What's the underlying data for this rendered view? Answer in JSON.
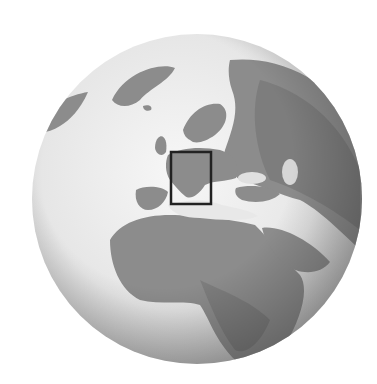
{
  "map": {
    "type": "orthographic-globe",
    "style": "grayscale",
    "center_region": "Europe / Africa",
    "highlight": {
      "label": "Alpine region / Italy",
      "x": 171,
      "y": 152,
      "width": 40,
      "height": 52,
      "stroke_color": "#222222"
    },
    "colors": {
      "ocean": "#efefef",
      "land": "#8a8a8a",
      "land_dark": "#6f6f6f",
      "background": "#ffffff"
    }
  }
}
